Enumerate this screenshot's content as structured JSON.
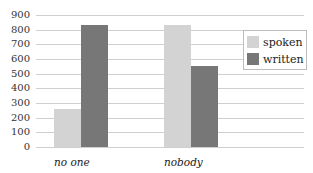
{
  "chart_data": {
    "type": "bar",
    "title": "",
    "xlabel": "",
    "ylabel": "",
    "categories": [
      "no one",
      "nobody"
    ],
    "series": [
      {
        "name": "spoken",
        "values": [
          260,
          830
        ],
        "color": "#d3d3d3"
      },
      {
        "name": "written",
        "values": [
          830,
          550
        ],
        "color": "#777777"
      }
    ],
    "ylim": [
      0,
      900
    ],
    "yticks": [
      "0",
      "100",
      "200",
      "300",
      "400",
      "500",
      "600",
      "700",
      "800",
      "900"
    ],
    "grid": true,
    "legend_position": "right"
  }
}
